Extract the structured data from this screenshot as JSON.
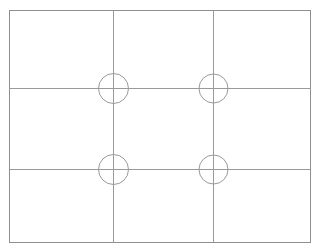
{
  "figure": {
    "canvas": {
      "width": 320,
      "height": 251,
      "background_color": "#ffffff"
    },
    "style": {
      "stroke_color": "#9a9a9a",
      "border_stroke_color": "#8f8f8f",
      "stroke_width": 1,
      "fill": "none"
    },
    "outer_rectangle": {
      "name": "outer-border",
      "x": 9,
      "y": 10,
      "width": 301,
      "height": 232
    },
    "vertical_lines": [
      {
        "name": "vertical-grid-line-1",
        "x": 113,
        "y1": 10,
        "y2": 242
      },
      {
        "name": "vertical-grid-line-2",
        "x": 213,
        "y1": 10,
        "y2": 242
      }
    ],
    "horizontal_lines": [
      {
        "name": "horizontal-grid-line-1",
        "y": 88,
        "x1": 9,
        "x2": 310
      },
      {
        "name": "horizontal-grid-line-2",
        "y": 169,
        "x1": 9,
        "x2": 310
      }
    ],
    "circles": [
      {
        "name": "circle-top-left",
        "cx": 113,
        "cy": 88,
        "r": 15
      },
      {
        "name": "circle-top-right",
        "cx": 213,
        "cy": 88,
        "r": 14.5
      },
      {
        "name": "circle-bottom-left",
        "cx": 113,
        "cy": 169,
        "r": 15
      },
      {
        "name": "circle-bottom-right",
        "cx": 213,
        "cy": 169,
        "r": 14.5
      }
    ],
    "counts": {
      "rows": 3,
      "columns": 3,
      "circles": 4
    }
  }
}
